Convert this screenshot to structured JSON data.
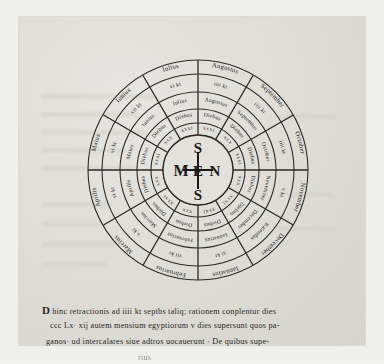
{
  "folio": {
    "kind": "manuscript-leaf",
    "ink_color": "#23211e",
    "parchment_color": "#dedcd7"
  },
  "rota": {
    "title": "calendar-wheel",
    "hub": {
      "letters": {
        "top": "S",
        "left": "M",
        "center": "E",
        "right": "N",
        "bottom": "S"
      },
      "expansion": "MENSES"
    },
    "sectors": [
      {
        "index": 0,
        "month": "Ianuarius",
        "outer": "Ianuarius",
        "kalends": "xi kt",
        "mid": "Ianuarius",
        "dies": "Diebus",
        "days": "xxxi"
      },
      {
        "index": 1,
        "month": "Februarius",
        "outer": "Februarius",
        "kalends": "vii kt",
        "mid": "Februarius",
        "dies": "Diebus",
        "days": "xxx"
      },
      {
        "index": 2,
        "month": "Marcius",
        "outer": "Marcius",
        "kalends": "v kt",
        "mid": "Marcius",
        "dies": "Diebus",
        "days": "xxxi"
      },
      {
        "index": 3,
        "month": "Aprilis",
        "outer": "Aprilis",
        "kalends": "vi kt",
        "mid": "Aprilis",
        "dies": "Diebus",
        "days": "xxx"
      },
      {
        "index": 4,
        "month": "Maius",
        "outer": "Maius",
        "kalends": "vi kt",
        "mid": "Maius",
        "dies": "Diebus",
        "days": "xxxi"
      },
      {
        "index": 5,
        "month": "Iunius",
        "outer": "Iunius",
        "kalends": "vii kt",
        "mid": "Iunius",
        "dies": "Diebus",
        "days": "xxx"
      },
      {
        "index": 6,
        "month": "Iulius",
        "outer": "Iulius",
        "kalends": "vi kt",
        "mid": "Iulius",
        "dies": "Diebus",
        "days": "xxxi"
      },
      {
        "index": 7,
        "month": "Augustus",
        "outer": "Augustus",
        "kalends": "iiii kt",
        "mid": "Augustus",
        "dies": "Diebus",
        "days": "xxxi"
      },
      {
        "index": 8,
        "month": "September",
        "outer": "September",
        "kalends": "iiii kt",
        "mid": "September",
        "dies": "Diebus",
        "days": "xxx"
      },
      {
        "index": 9,
        "month": "October",
        "outer": "October",
        "kalends": "iiii kt",
        "mid": "October",
        "dies": "Diebus",
        "days": "xxxi"
      },
      {
        "index": 10,
        "month": "November",
        "outer": "November",
        "kalends": "v kt",
        "mid": "November",
        "dies": "Diebus",
        "days": "xxx"
      },
      {
        "index": 11,
        "month": "December",
        "outer": "December",
        "kalends": "Kalendas",
        "mid": "December",
        "dies": "Diebus",
        "days": "xxxi"
      }
    ]
  },
  "caption": {
    "initial": "D",
    "line1": "hinc retractionis ad iiii kt septbs taliq; rationem conplentur dies",
    "line2": "ccc Lx· xij autem mensium egyptiorum v dies supersunt quos pa-",
    "line3": "ganos· ud intercalares siue adtros uocauerunt · De quibus supe-",
    "line4": "rius"
  }
}
